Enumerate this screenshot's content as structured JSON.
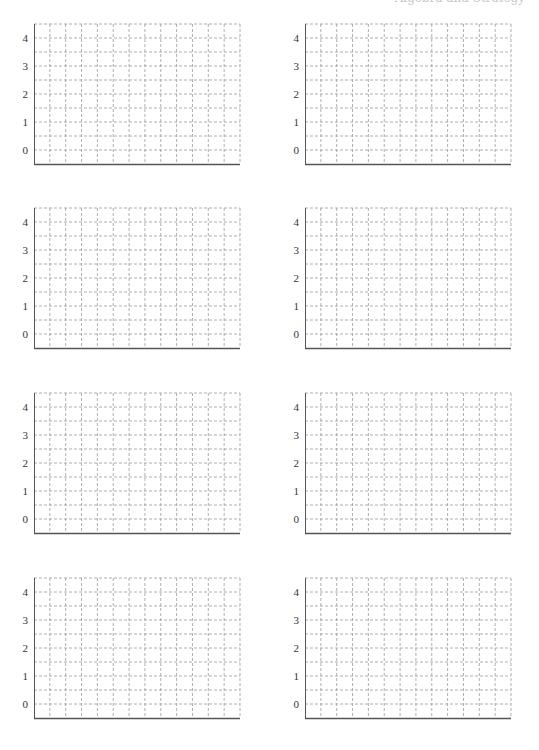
{
  "header": {
    "clipped_text": "Algebra and Strategy"
  },
  "layout": {
    "columns": 2,
    "rows": 4,
    "panel_x": [
      34,
      305
    ],
    "panel_y_top": [
      24,
      208,
      393,
      578
    ],
    "panel_width": 206,
    "panel_height": 140
  },
  "grid": {
    "vertical_divisions": 13,
    "horizontal_divisions": 10,
    "line_color": "#9a9a9a",
    "axis_color": "#555555",
    "dash": "3,2"
  },
  "panels": [
    {
      "id": "graph-1",
      "y_ticks": [
        "4",
        "3",
        "2",
        "1",
        "0"
      ]
    },
    {
      "id": "graph-2",
      "y_ticks": [
        "4",
        "3",
        "2",
        "1",
        "0"
      ]
    },
    {
      "id": "graph-3",
      "y_ticks": [
        "4",
        "3",
        "2",
        "1",
        "0"
      ]
    },
    {
      "id": "graph-4",
      "y_ticks": [
        "4",
        "3",
        "2",
        "1",
        "0"
      ]
    },
    {
      "id": "graph-5",
      "y_ticks": [
        "4",
        "3",
        "2",
        "1",
        "0"
      ]
    },
    {
      "id": "graph-6",
      "y_ticks": [
        "4",
        "3",
        "2",
        "1",
        "0"
      ]
    },
    {
      "id": "graph-7",
      "y_ticks": [
        "4",
        "3",
        "2",
        "1",
        "0"
      ]
    },
    {
      "id": "graph-8",
      "y_ticks": [
        "4",
        "3",
        "2",
        "1",
        "0"
      ]
    }
  ]
}
